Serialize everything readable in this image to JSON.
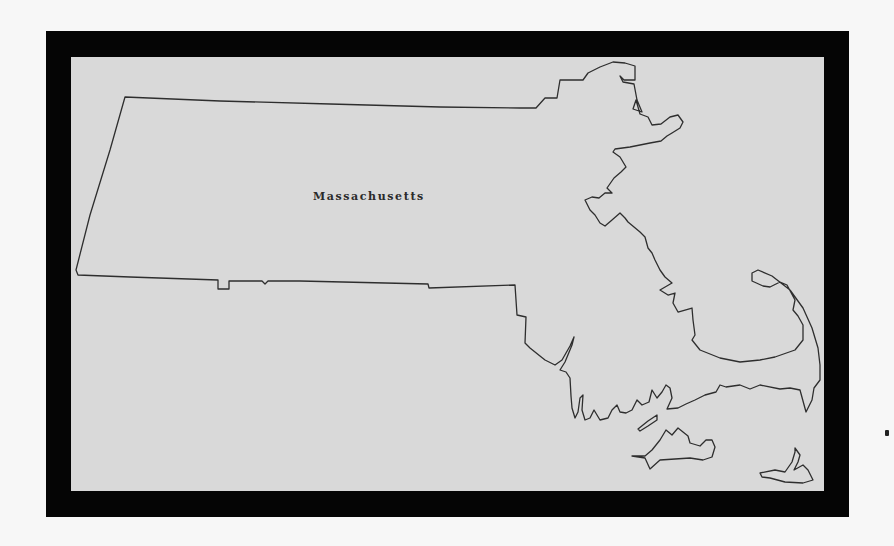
{
  "map": {
    "title": "Massachusetts",
    "state_label": "Massachusetts",
    "colors": {
      "page_background": "#f7f7f7",
      "frame": "#050505",
      "map_background": "#d9d9d9",
      "outline": "#2e2e2e"
    },
    "features": [
      {
        "name": "Massachusetts mainland",
        "type": "state-outline"
      },
      {
        "name": "Cape Cod",
        "type": "peninsula"
      },
      {
        "name": "Martha's Vineyard",
        "type": "island"
      },
      {
        "name": "Nantucket",
        "type": "island"
      },
      {
        "name": "Elizabeth Islands",
        "type": "island"
      }
    ]
  }
}
